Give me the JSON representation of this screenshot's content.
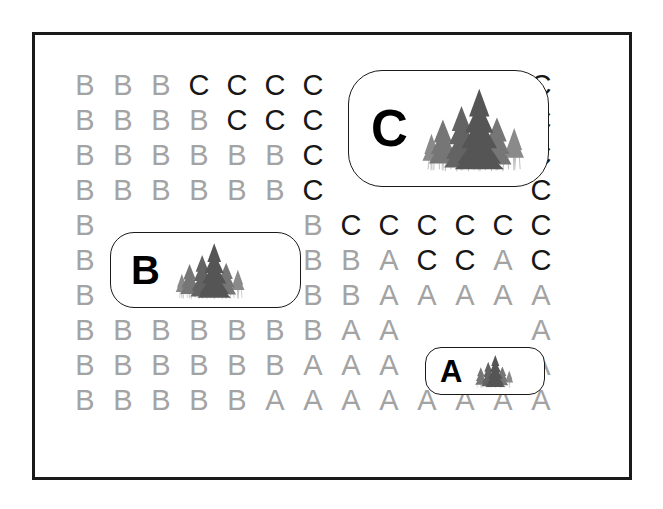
{
  "page": {
    "background_color": "#ffffff",
    "frame_color": "#1a1a1a"
  },
  "legend_colors": {
    "light_letter": "#a3a3a3",
    "dark_letter": "#171717",
    "callout_letter": "#000000",
    "callout_border": "#1a1a1a"
  },
  "grid": {
    "columns": 13,
    "rows": 10,
    "origin_x": 85,
    "origin_y": 70,
    "col_step": 38,
    "row_step": 35,
    "cells": [
      [
        {
          "letter": "B",
          "tone": "light"
        },
        {
          "letter": "B",
          "tone": "light"
        },
        {
          "letter": "B",
          "tone": "light"
        },
        {
          "letter": "C",
          "tone": "dark"
        },
        {
          "letter": "C",
          "tone": "dark"
        },
        {
          "letter": "C",
          "tone": "dark"
        },
        {
          "letter": "C",
          "tone": "dark"
        },
        {
          "letter": "",
          "tone": "hidden"
        },
        {
          "letter": "",
          "tone": "hidden"
        },
        {
          "letter": "",
          "tone": "hidden"
        },
        {
          "letter": "",
          "tone": "hidden"
        },
        {
          "letter": "",
          "tone": "hidden"
        },
        {
          "letter": "C",
          "tone": "dark"
        }
      ],
      [
        {
          "letter": "B",
          "tone": "light"
        },
        {
          "letter": "B",
          "tone": "light"
        },
        {
          "letter": "B",
          "tone": "light"
        },
        {
          "letter": "B",
          "tone": "light"
        },
        {
          "letter": "C",
          "tone": "dark"
        },
        {
          "letter": "C",
          "tone": "dark"
        },
        {
          "letter": "C",
          "tone": "dark"
        },
        {
          "letter": "",
          "tone": "hidden"
        },
        {
          "letter": "",
          "tone": "hidden"
        },
        {
          "letter": "",
          "tone": "hidden"
        },
        {
          "letter": "",
          "tone": "hidden"
        },
        {
          "letter": "",
          "tone": "hidden"
        },
        {
          "letter": "C",
          "tone": "dark"
        }
      ],
      [
        {
          "letter": "B",
          "tone": "light"
        },
        {
          "letter": "B",
          "tone": "light"
        },
        {
          "letter": "B",
          "tone": "light"
        },
        {
          "letter": "B",
          "tone": "light"
        },
        {
          "letter": "B",
          "tone": "light"
        },
        {
          "letter": "B",
          "tone": "light"
        },
        {
          "letter": "C",
          "tone": "dark"
        },
        {
          "letter": "",
          "tone": "hidden"
        },
        {
          "letter": "",
          "tone": "hidden"
        },
        {
          "letter": "",
          "tone": "hidden"
        },
        {
          "letter": "",
          "tone": "hidden"
        },
        {
          "letter": "",
          "tone": "hidden"
        },
        {
          "letter": "C",
          "tone": "dark"
        }
      ],
      [
        {
          "letter": "B",
          "tone": "light"
        },
        {
          "letter": "B",
          "tone": "light"
        },
        {
          "letter": "B",
          "tone": "light"
        },
        {
          "letter": "B",
          "tone": "light"
        },
        {
          "letter": "B",
          "tone": "light"
        },
        {
          "letter": "B",
          "tone": "light"
        },
        {
          "letter": "C",
          "tone": "dark"
        },
        {
          "letter": "",
          "tone": "hidden"
        },
        {
          "letter": "",
          "tone": "hidden"
        },
        {
          "letter": "",
          "tone": "hidden"
        },
        {
          "letter": "",
          "tone": "hidden"
        },
        {
          "letter": "",
          "tone": "hidden"
        },
        {
          "letter": "C",
          "tone": "dark"
        }
      ],
      [
        {
          "letter": "B",
          "tone": "light"
        },
        {
          "letter": "",
          "tone": "hidden"
        },
        {
          "letter": "",
          "tone": "hidden"
        },
        {
          "letter": "",
          "tone": "hidden"
        },
        {
          "letter": "",
          "tone": "hidden"
        },
        {
          "letter": "",
          "tone": "hidden"
        },
        {
          "letter": "B",
          "tone": "light"
        },
        {
          "letter": "C",
          "tone": "dark"
        },
        {
          "letter": "C",
          "tone": "dark"
        },
        {
          "letter": "C",
          "tone": "dark"
        },
        {
          "letter": "C",
          "tone": "dark"
        },
        {
          "letter": "C",
          "tone": "dark"
        },
        {
          "letter": "C",
          "tone": "dark"
        }
      ],
      [
        {
          "letter": "B",
          "tone": "light"
        },
        {
          "letter": "",
          "tone": "hidden"
        },
        {
          "letter": "",
          "tone": "hidden"
        },
        {
          "letter": "",
          "tone": "hidden"
        },
        {
          "letter": "",
          "tone": "hidden"
        },
        {
          "letter": "",
          "tone": "hidden"
        },
        {
          "letter": "B",
          "tone": "light"
        },
        {
          "letter": "B",
          "tone": "light"
        },
        {
          "letter": "A",
          "tone": "light"
        },
        {
          "letter": "C",
          "tone": "dark"
        },
        {
          "letter": "C",
          "tone": "dark"
        },
        {
          "letter": "A",
          "tone": "light"
        },
        {
          "letter": "C",
          "tone": "dark"
        }
      ],
      [
        {
          "letter": "B",
          "tone": "light"
        },
        {
          "letter": "",
          "tone": "hidden"
        },
        {
          "letter": "",
          "tone": "hidden"
        },
        {
          "letter": "",
          "tone": "hidden"
        },
        {
          "letter": "",
          "tone": "hidden"
        },
        {
          "letter": "",
          "tone": "hidden"
        },
        {
          "letter": "B",
          "tone": "light"
        },
        {
          "letter": "B",
          "tone": "light"
        },
        {
          "letter": "A",
          "tone": "light"
        },
        {
          "letter": "A",
          "tone": "light"
        },
        {
          "letter": "A",
          "tone": "light"
        },
        {
          "letter": "A",
          "tone": "light"
        },
        {
          "letter": "A",
          "tone": "light"
        }
      ],
      [
        {
          "letter": "B",
          "tone": "light"
        },
        {
          "letter": "B",
          "tone": "light"
        },
        {
          "letter": "B",
          "tone": "light"
        },
        {
          "letter": "B",
          "tone": "light"
        },
        {
          "letter": "B",
          "tone": "light"
        },
        {
          "letter": "B",
          "tone": "light"
        },
        {
          "letter": "B",
          "tone": "light"
        },
        {
          "letter": "A",
          "tone": "light"
        },
        {
          "letter": "A",
          "tone": "light"
        },
        {
          "letter": "",
          "tone": "hidden"
        },
        {
          "letter": "",
          "tone": "hidden"
        },
        {
          "letter": "",
          "tone": "hidden"
        },
        {
          "letter": "A",
          "tone": "light"
        }
      ],
      [
        {
          "letter": "B",
          "tone": "light"
        },
        {
          "letter": "B",
          "tone": "light"
        },
        {
          "letter": "B",
          "tone": "light"
        },
        {
          "letter": "B",
          "tone": "light"
        },
        {
          "letter": "B",
          "tone": "light"
        },
        {
          "letter": "B",
          "tone": "light"
        },
        {
          "letter": "A",
          "tone": "light"
        },
        {
          "letter": "A",
          "tone": "light"
        },
        {
          "letter": "A",
          "tone": "light"
        },
        {
          "letter": "",
          "tone": "hidden"
        },
        {
          "letter": "",
          "tone": "hidden"
        },
        {
          "letter": "",
          "tone": "hidden"
        },
        {
          "letter": "A",
          "tone": "light"
        }
      ],
      [
        {
          "letter": "B",
          "tone": "light"
        },
        {
          "letter": "B",
          "tone": "light"
        },
        {
          "letter": "B",
          "tone": "light"
        },
        {
          "letter": "B",
          "tone": "light"
        },
        {
          "letter": "B",
          "tone": "light"
        },
        {
          "letter": "A",
          "tone": "light"
        },
        {
          "letter": "A",
          "tone": "light"
        },
        {
          "letter": "A",
          "tone": "light"
        },
        {
          "letter": "A",
          "tone": "light"
        },
        {
          "letter": "A",
          "tone": "light"
        },
        {
          "letter": "A",
          "tone": "light"
        },
        {
          "letter": "A",
          "tone": "light"
        },
        {
          "letter": "A",
          "tone": "light"
        }
      ]
    ]
  },
  "callouts": {
    "c": {
      "letter": "C",
      "icon": "conifer-forest-stand-icon",
      "size": "large"
    },
    "b": {
      "letter": "B",
      "icon": "conifer-forest-stand-icon",
      "size": "medium"
    },
    "a": {
      "letter": "A",
      "icon": "conifer-forest-stand-icon",
      "size": "small"
    }
  }
}
